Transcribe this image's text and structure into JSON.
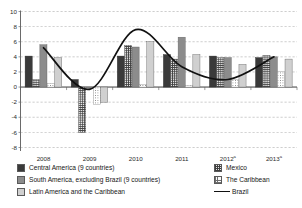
{
  "chart_data": {
    "type": "bar",
    "title": "",
    "subtitle": "",
    "xlabel": "",
    "ylabel": "",
    "ylim": [
      -8,
      10
    ],
    "yticks": [
      -8,
      -6,
      -4,
      -2,
      0,
      2,
      4,
      6,
      8,
      10
    ],
    "ytick_labels": [
      "-8",
      "-6",
      "-4",
      "-2",
      "0",
      "2",
      "4",
      "6",
      "8",
      "10"
    ],
    "categories": [
      "2008",
      "2009",
      "2010",
      "2011",
      "2012",
      "2013"
    ],
    "category_labels": [
      "2008",
      "2009",
      "2010",
      "2011",
      "2012ᵃ",
      "2013ᵃ"
    ],
    "category_footnote_marker": "a",
    "grid": true,
    "grid_style": "dashed-horizontal",
    "legend_position": "bottom",
    "legend_columns": 2,
    "series": [
      {
        "name": "Central America (9 countries)",
        "kind": "bar",
        "pattern": "solid-dark",
        "color": "#3a3a3a",
        "values": [
          4.1,
          1.0,
          4.1,
          4.3,
          4.1,
          3.9
        ]
      },
      {
        "name": "Mexico",
        "kind": "bar",
        "pattern": "crosshatch",
        "color": "#e8e8e8",
        "values": [
          1.0,
          -6.0,
          5.5,
          3.7,
          3.9,
          4.2
        ]
      },
      {
        "name": "South America, excluding Brazil (9 countries)",
        "kind": "bar",
        "pattern": "solid-mid-gray",
        "color": "#8c8c8c",
        "values": [
          5.6,
          -0.2,
          5.3,
          6.6,
          3.9,
          4.0
        ]
      },
      {
        "name": "The Caribbean",
        "kind": "bar",
        "pattern": "dotted",
        "color": "#fbfbfb",
        "values": [
          0.5,
          -2.3,
          0.3,
          0.2,
          1.0,
          2.1
        ]
      },
      {
        "name": "Latin America and the Caribbean",
        "kind": "bar",
        "pattern": "solid-light-gray",
        "color": "#d0d0d0",
        "values": [
          3.9,
          -2.0,
          6.0,
          4.3,
          3.0,
          3.7
        ]
      },
      {
        "name": "Brazil",
        "kind": "line",
        "pattern": "solid-line",
        "color": "#111111",
        "values": [
          5.2,
          -0.3,
          7.6,
          2.7,
          1.0,
          4.0
        ]
      }
    ]
  },
  "legend": {
    "column_left": [
      "Central America (9 countries)",
      "South America, excluding Brazil (9 countries)",
      "Latin America and the Caribbean"
    ],
    "column_right": [
      "Mexico",
      "The Caribbean",
      "Brazil"
    ]
  }
}
